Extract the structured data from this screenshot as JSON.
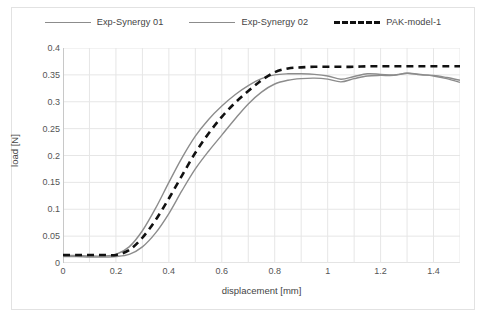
{
  "chart_data": {
    "type": "line",
    "title": "",
    "xlabel": "displacement [mm]",
    "ylabel": "load [N]",
    "xlim": [
      0,
      1.5
    ],
    "ylim": [
      0,
      0.4
    ],
    "xticks": [
      "0",
      "0.2",
      "0.4",
      "0.6",
      "0.8",
      "1",
      "1.2",
      "1.4"
    ],
    "xtick_values": [
      0,
      0.2,
      0.4,
      0.6,
      0.8,
      1.0,
      1.2,
      1.4
    ],
    "yticks": [
      "0",
      "0.05",
      "0.1",
      "0.15",
      "0.2",
      "0.25",
      "0.3",
      "0.35",
      "0.4"
    ],
    "ytick_values": [
      0,
      0.05,
      0.1,
      0.15,
      0.2,
      0.25,
      0.3,
      0.35,
      0.4
    ],
    "grid": "both",
    "legend_position": "top-center",
    "series": [
      {
        "name": "Exp-Synergy 01",
        "color": "#8c8c8c",
        "style": "solid",
        "width": 1.4,
        "x": [
          0.0,
          0.05,
          0.1,
          0.15,
          0.2,
          0.25,
          0.3,
          0.35,
          0.4,
          0.45,
          0.5,
          0.55,
          0.6,
          0.65,
          0.7,
          0.75,
          0.8,
          0.85,
          0.9,
          0.95,
          1.0,
          1.05,
          1.1,
          1.15,
          1.2,
          1.25,
          1.3,
          1.35,
          1.4,
          1.45,
          1.5
        ],
        "y": [
          0.014,
          0.014,
          0.013,
          0.013,
          0.016,
          0.03,
          0.06,
          0.102,
          0.15,
          0.196,
          0.236,
          0.267,
          0.292,
          0.313,
          0.33,
          0.343,
          0.35,
          0.352,
          0.352,
          0.351,
          0.348,
          0.342,
          0.347,
          0.352,
          0.351,
          0.35,
          0.353,
          0.35,
          0.349,
          0.345,
          0.34
        ]
      },
      {
        "name": "Exp-Synergy 02",
        "color": "#8c8c8c",
        "style": "solid",
        "width": 1.4,
        "x": [
          0.0,
          0.05,
          0.1,
          0.15,
          0.2,
          0.25,
          0.3,
          0.35,
          0.4,
          0.45,
          0.5,
          0.55,
          0.6,
          0.65,
          0.7,
          0.75,
          0.8,
          0.85,
          0.9,
          0.95,
          1.0,
          1.05,
          1.1,
          1.15,
          1.2,
          1.25,
          1.3,
          1.35,
          1.4,
          1.45,
          1.5
        ],
        "y": [
          0.012,
          0.012,
          0.011,
          0.011,
          0.012,
          0.016,
          0.03,
          0.056,
          0.092,
          0.135,
          0.175,
          0.208,
          0.238,
          0.268,
          0.296,
          0.318,
          0.333,
          0.34,
          0.343,
          0.344,
          0.342,
          0.337,
          0.343,
          0.348,
          0.349,
          0.349,
          0.353,
          0.351,
          0.348,
          0.343,
          0.336
        ]
      },
      {
        "name": "PAK-model-1",
        "color": "#111111",
        "style": "dashed",
        "width": 2.6,
        "x": [
          0.0,
          0.05,
          0.1,
          0.15,
          0.2,
          0.25,
          0.3,
          0.35,
          0.4,
          0.45,
          0.5,
          0.55,
          0.6,
          0.65,
          0.7,
          0.75,
          0.8,
          0.85,
          0.9,
          0.95,
          1.0,
          1.05,
          1.1,
          1.15,
          1.2,
          1.25,
          1.3,
          1.35,
          1.4,
          1.45,
          1.5
        ],
        "y": [
          0.015,
          0.015,
          0.015,
          0.015,
          0.015,
          0.024,
          0.047,
          0.08,
          0.12,
          0.163,
          0.205,
          0.241,
          0.272,
          0.298,
          0.32,
          0.34,
          0.355,
          0.362,
          0.364,
          0.365,
          0.365,
          0.365,
          0.365,
          0.366,
          0.366,
          0.366,
          0.366,
          0.366,
          0.366,
          0.366,
          0.366
        ]
      }
    ]
  },
  "legend": {
    "items": [
      {
        "label": "Exp-Synergy 01",
        "style": "solid",
        "color": "#8c8c8c"
      },
      {
        "label": "Exp-Synergy 02",
        "style": "solid",
        "color": "#8c8c8c"
      },
      {
        "label": "PAK-model-1",
        "style": "dashed",
        "color": "#111111"
      }
    ]
  },
  "axes": {
    "x_title": "displacement [mm]",
    "y_title": "load [N]"
  }
}
